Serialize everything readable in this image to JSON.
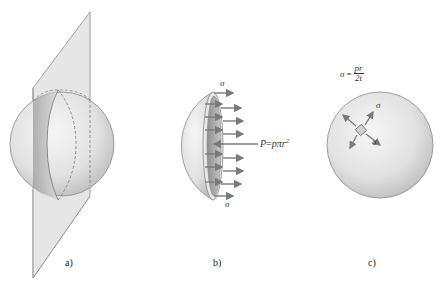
{
  "figure": {
    "panels": [
      {
        "id": "a",
        "label": "a)",
        "description": "Sphere cut by an inclined plane through its center"
      },
      {
        "id": "b",
        "label": "b)",
        "description": "Hemisphere free body with stress arrows and resultant pressure force"
      },
      {
        "id": "c",
        "label": "c)",
        "description": "Sphere with stress element showing biaxial equal stresses"
      }
    ],
    "panel_b": {
      "sigma_top": "σ",
      "sigma_bottom": "σ",
      "force_label": "P = pπr²",
      "force_label_parts": {
        "lhs": "P",
        "eq": "=",
        "rhs": "pπr",
        "sup": "2"
      }
    },
    "panel_c": {
      "formula": {
        "lhs": "σ",
        "eq": "=",
        "numerator": "pr",
        "denominator": "2t"
      },
      "sigma_upper": "σ",
      "sigma_lower": "σ"
    },
    "colors": {
      "sphere_light": "#f2f2f2",
      "sphere_dark": "#b8b8b8",
      "plane_fill": "#e4e4e4",
      "stroke": "#777777",
      "arrow": "#7a7a7a",
      "cut_face": "#9a9a9a"
    }
  }
}
